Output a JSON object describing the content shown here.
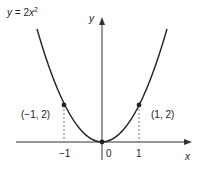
{
  "equation": {
    "lhs": "y",
    "eq": " = 2",
    "var": "x",
    "exp": "2"
  },
  "axes": {
    "x_label": "x",
    "y_label": "y"
  },
  "ticks": {
    "neg1": "−1",
    "zero": "0",
    "pos1": "1"
  },
  "points": [
    {
      "label": "(−1, 2)",
      "x": -1,
      "y": 2
    },
    {
      "label": "(1, 2)",
      "x": 1,
      "y": 2
    }
  ],
  "colors": {
    "curve": "#222222",
    "axis": "#333333",
    "dashed": "#555555"
  }
}
